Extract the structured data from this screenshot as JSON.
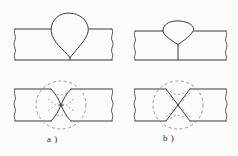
{
  "figure": {
    "background_color": "#fbfbfa",
    "line_color": "#3a3a3a",
    "dashed_color": "#8d8d8d",
    "captions": [
      {
        "id": "a",
        "label": "a )"
      },
      {
        "id": "b",
        "label": "b )"
      }
    ],
    "panels": [
      {
        "id": "panel-top-left",
        "group": "a",
        "row": "top",
        "name": "weld-bead-teardrop-cross-section",
        "description": "Plate with a tall teardrop / pear shaped weld bead on top, pointed root at the bottom surface",
        "bead_shape": "teardrop",
        "bead_height": 42,
        "bead_width": 46,
        "plate_left_edge": "wavy-break-line",
        "plate_right_edge": "wavy-break-line",
        "root_marker": "short-vertical-tick"
      },
      {
        "id": "panel-top-right",
        "group": "b",
        "row": "top",
        "name": "weld-bead-shallow-cross-section",
        "description": "Plate with a low wide rounded-triangular weld bead on top and a vertical root line through the plate",
        "bead_shape": "rounded-triangle",
        "bead_height": 20,
        "bead_width": 50,
        "plate_left_edge": "wavy-break-line",
        "plate_right_edge": "wavy-break-line",
        "root_marker": "full-vertical-line"
      },
      {
        "id": "panel-bottom-left",
        "group": "a",
        "row": "bottom",
        "name": "fracture-pattern-curved-x",
        "description": "Plate with a curved bowtie / X fracture pattern enclosed by a dashed circle, with small dashed chevrons inside",
        "fracture_shape": "curved-x",
        "annotation_circle": "dashed",
        "annotation_circle_diameter": 50,
        "inner_marks": "dashed-chevrons"
      },
      {
        "id": "panel-bottom-right",
        "group": "b",
        "row": "bottom",
        "name": "fracture-pattern-straight-x",
        "description": "Plate with a straight-line X fracture pattern enclosed by a dashed ellipse, with dashed arc arrows inside",
        "fracture_shape": "straight-x",
        "annotation_circle": "dashed",
        "annotation_circle_diameter": 50,
        "inner_marks": "dashed-arc-arrows"
      }
    ]
  }
}
